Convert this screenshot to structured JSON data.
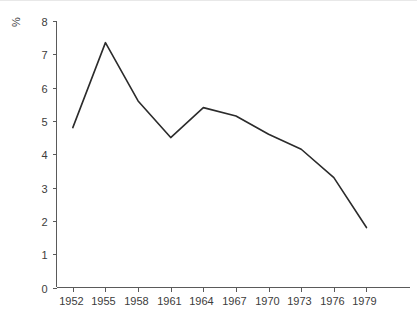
{
  "chart_data": {
    "type": "line",
    "title": "",
    "subtitle": "",
    "xlabel": "",
    "ylabel": "%",
    "x": [
      1952,
      1955,
      1958,
      1961,
      1964,
      1967,
      1970,
      1973,
      1976,
      1979
    ],
    "values": [
      4.8,
      7.35,
      5.6,
      4.5,
      5.4,
      5.15,
      4.6,
      4.15,
      3.3,
      1.8
    ],
    "series": [
      {
        "name": "",
        "values": [
          4.8,
          7.35,
          5.6,
          4.5,
          5.4,
          5.15,
          4.6,
          4.15,
          3.3,
          1.8
        ]
      }
    ],
    "xtick_labels": [
      "1952",
      "1955",
      "1958",
      "1961",
      "1964",
      "1967",
      "1970",
      "1973",
      "1976",
      "1979"
    ],
    "ytick_labels": [
      "0",
      "1",
      "2",
      "3",
      "4",
      "5",
      "6",
      "7",
      "8"
    ],
    "ytick_values": [
      0,
      1,
      2,
      3,
      4,
      5,
      6,
      7,
      8
    ],
    "xlim": [
      1950.5,
      1983.0
    ],
    "ylim": [
      0,
      8
    ],
    "grid": false,
    "legend": false,
    "legend_position": "none",
    "line_color": "#2b2b2b",
    "axis_color": "#5a5a5a",
    "text_color": "#3c3c3c",
    "background_color": "#ffffff",
    "annotations": []
  },
  "axes": {
    "y_axis_title": "%"
  }
}
